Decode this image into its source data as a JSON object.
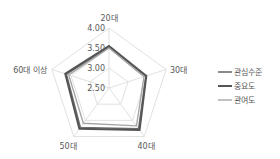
{
  "chart_data": {
    "type": "radar",
    "title": "",
    "categories": [
      "20대",
      "30대",
      "40대",
      "50대",
      "60대 이상"
    ],
    "rlim": [
      2.5,
      4.0
    ],
    "ticks": [
      2.5,
      3.0,
      3.5,
      4.0
    ],
    "tick_labels": [
      "2.50",
      "3.00",
      "3.50",
      "4.00"
    ],
    "grid": true,
    "legend_position": "right",
    "series": [
      {
        "name": "관심수준",
        "values": [
          3.52,
          3.47,
          3.76,
          3.72,
          3.62
        ],
        "color": "#6e6e6e",
        "width": 1.6
      },
      {
        "name": "중요도",
        "values": [
          3.55,
          3.48,
          3.8,
          3.76,
          3.65
        ],
        "color": "#555555",
        "width": 2.0
      },
      {
        "name": "관여도",
        "values": [
          3.5,
          3.42,
          3.67,
          3.59,
          3.56
        ],
        "color": "#a6a6a6",
        "width": 1.4
      }
    ]
  }
}
